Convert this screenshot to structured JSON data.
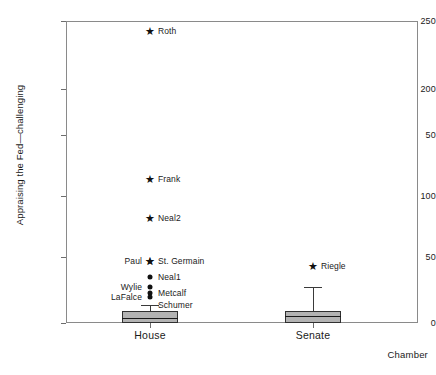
{
  "chart_data": {
    "type": "box",
    "title": "",
    "xlabel": "Chamber",
    "ylabel": "Appraising the Fed—challenging",
    "categories": [
      "House",
      "Senate"
    ],
    "ylim": [
      0,
      250
    ],
    "yticks": [
      {
        "label": "250",
        "value": 250
      },
      {
        "label": "200",
        "value": 200
      },
      {
        "label": "50",
        "value": 150
      },
      {
        "label": "100",
        "value": 100
      },
      {
        "label": "50",
        "value": 50
      },
      {
        "label": "0",
        "value": 0
      }
    ],
    "grid": false,
    "legend": "none",
    "boxes": [
      {
        "category": "House",
        "min": 0,
        "q1": 0,
        "median": 4,
        "q3": 9,
        "max": 14
      },
      {
        "category": "Senate",
        "min": 0,
        "q1": 0,
        "median": 5,
        "q3": 9,
        "max": 27
      }
    ],
    "outliers": [
      {
        "category": "House",
        "label": "Roth",
        "value": 243,
        "marker": "star",
        "label_side": "right"
      },
      {
        "category": "House",
        "label": "Frank",
        "value": 114,
        "marker": "star",
        "label_side": "right"
      },
      {
        "category": "House",
        "label": "Neal2",
        "value": 82,
        "marker": "star",
        "label_side": "right"
      },
      {
        "category": "House",
        "label": "St. Germain",
        "value": 47,
        "marker": "star",
        "label_side": "right"
      },
      {
        "category": "House",
        "label": "Paul",
        "value": 47,
        "marker": "star",
        "label_side": "left"
      },
      {
        "category": "House",
        "label": "Neal1",
        "value": 35,
        "marker": "dot",
        "label_side": "right"
      },
      {
        "category": "House",
        "label": "Wylie",
        "value": 27,
        "marker": "dot",
        "label_side": "left"
      },
      {
        "category": "House",
        "label": "Metcalf",
        "value": 23,
        "marker": "dot",
        "label_side": "right"
      },
      {
        "category": "House",
        "label": "LaFalce",
        "value": 20,
        "marker": "dot",
        "label_side": "left"
      },
      {
        "category": "House",
        "label": "Schumer",
        "value": 14,
        "marker": "none",
        "label_side": "right"
      },
      {
        "category": "Senate",
        "label": "Riegle",
        "value": 43,
        "marker": "star",
        "label_side": "right"
      }
    ],
    "colors": {
      "box_fill": "#b3b3b3",
      "box_edge": "#303030",
      "marker": "#111111",
      "axis": "#8a8a8a",
      "text": "#1a1a1a"
    }
  },
  "caption": {
    "text": "Figure 000"
  }
}
